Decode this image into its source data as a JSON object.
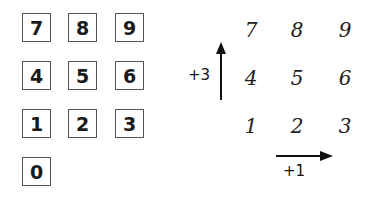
{
  "keypad": {
    "keys": [
      {
        "label": "7",
        "x": 22,
        "y": 13
      },
      {
        "label": "8",
        "x": 68,
        "y": 13
      },
      {
        "label": "9",
        "x": 115,
        "y": 13
      },
      {
        "label": "4",
        "x": 22,
        "y": 61
      },
      {
        "label": "5",
        "x": 68,
        "y": 61
      },
      {
        "label": "6",
        "x": 115,
        "y": 61
      },
      {
        "label": "1",
        "x": 22,
        "y": 109
      },
      {
        "label": "2",
        "x": 68,
        "y": 109
      },
      {
        "label": "3",
        "x": 115,
        "y": 109
      },
      {
        "label": "0",
        "x": 22,
        "y": 157
      }
    ]
  },
  "grid": {
    "numbers": [
      {
        "label": "7",
        "x": 251,
        "y": 30
      },
      {
        "label": "8",
        "x": 297,
        "y": 30
      },
      {
        "label": "9",
        "x": 345,
        "y": 30
      },
      {
        "label": "4",
        "x": 251,
        "y": 78
      },
      {
        "label": "5",
        "x": 297,
        "y": 78
      },
      {
        "label": "6",
        "x": 345,
        "y": 78
      },
      {
        "label": "1",
        "x": 251,
        "y": 126
      },
      {
        "label": "2",
        "x": 297,
        "y": 126
      },
      {
        "label": "3",
        "x": 345,
        "y": 126
      }
    ],
    "vertical_step_label": "+3",
    "horizontal_step_label": "+1"
  }
}
